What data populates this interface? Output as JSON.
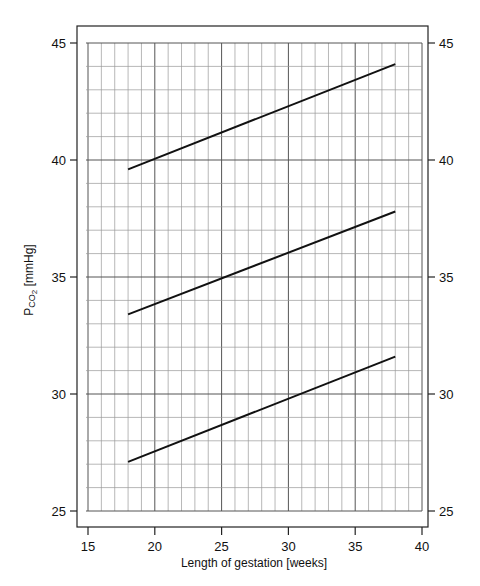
{
  "chart_data": {
    "type": "line",
    "title": "",
    "xlabel": "Length of gestation [weeks]",
    "ylabel": "Pco2 [mmHg]",
    "ylabel_parts": {
      "main": "P",
      "sub1": "CO",
      "sub2": "2",
      "units": " [mmHg]"
    },
    "xlim": [
      15,
      40
    ],
    "ylim": [
      25,
      45
    ],
    "xticks": [
      15,
      20,
      25,
      30,
      35,
      40
    ],
    "yticks": [
      25,
      30,
      35,
      40,
      45
    ],
    "y_right_axis_ticks": [
      25,
      30,
      35,
      40,
      45
    ],
    "grid": {
      "on": true,
      "x_minor_step": 1,
      "y_minor_step": 1,
      "major_step": 5
    },
    "legend": null,
    "series": [
      {
        "name": "upper",
        "x": [
          18,
          38
        ],
        "y": [
          39.6,
          44.1
        ]
      },
      {
        "name": "middle",
        "x": [
          18,
          38
        ],
        "y": [
          33.4,
          37.8
        ]
      },
      {
        "name": "lower",
        "x": [
          18,
          38
        ],
        "y": [
          27.1,
          31.6
        ]
      }
    ],
    "colors": {
      "line": "#111111",
      "grid_minor": "#9a9a9a",
      "grid_major": "#555555",
      "frame": "#222222"
    }
  }
}
